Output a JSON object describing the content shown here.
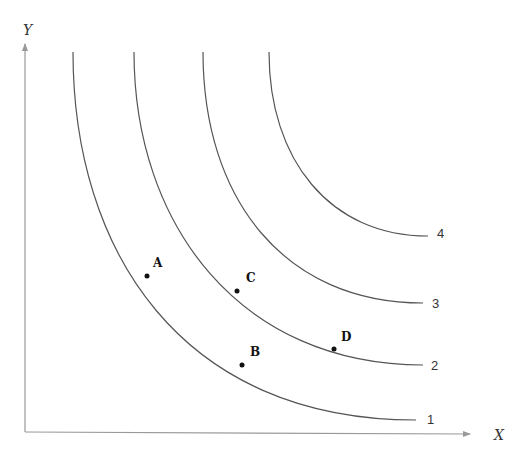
{
  "axes": {
    "x_label": "X",
    "y_label": "Y",
    "color": "#999999"
  },
  "curves": [
    {
      "label": "1",
      "start": [
        73,
        52
      ],
      "end": [
        416,
        420
      ]
    },
    {
      "label": "2",
      "start": [
        134,
        52
      ],
      "end": [
        423,
        365
      ]
    },
    {
      "label": "3",
      "start": [
        203,
        52
      ],
      "end": [
        423,
        303
      ]
    },
    {
      "label": "4",
      "start": [
        269,
        52
      ],
      "end": [
        428,
        236
      ]
    }
  ],
  "points": [
    {
      "label": "A",
      "curve": "1",
      "x": 147,
      "y": 276
    },
    {
      "label": "B",
      "curve": "1",
      "x": 242,
      "y": 365
    },
    {
      "label": "C",
      "curve": "2",
      "x": 237,
      "y": 291
    },
    {
      "label": "D",
      "curve": "2",
      "x": 334,
      "y": 349
    }
  ],
  "curve_color": "#555555"
}
